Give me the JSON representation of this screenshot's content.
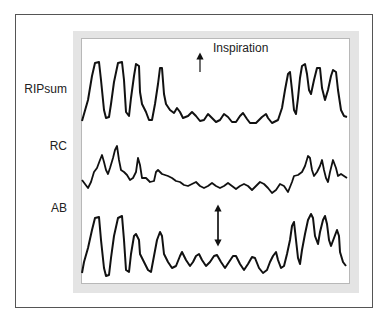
{
  "figure": {
    "annotation": "Inspiration",
    "channels": [
      {
        "id": "ripsum",
        "label": "RIPsum"
      },
      {
        "id": "rc",
        "label": "RC"
      },
      {
        "id": "ab",
        "label": "AB"
      }
    ],
    "arrows": [
      {
        "type": "up-arrow",
        "meaning": "Inspiration direction"
      },
      {
        "type": "double-headed-arrow",
        "meaning": "amplitude"
      }
    ],
    "colors": {
      "trace": "#111111",
      "frame": "#555555",
      "panel": "#e4e4e4"
    }
  }
}
